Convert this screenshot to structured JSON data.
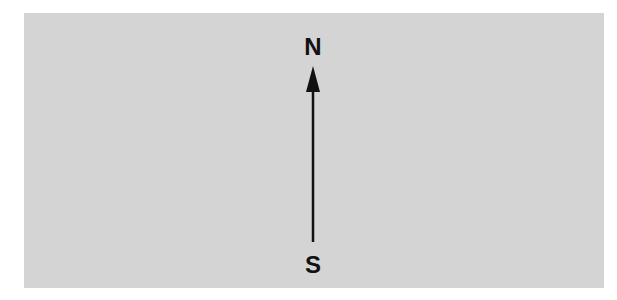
{
  "diagram": {
    "north_label": "N",
    "south_label": "S",
    "background_color": "#d4d4d4",
    "arrow": {
      "direction": "south-to-north",
      "color": "#111111"
    }
  }
}
